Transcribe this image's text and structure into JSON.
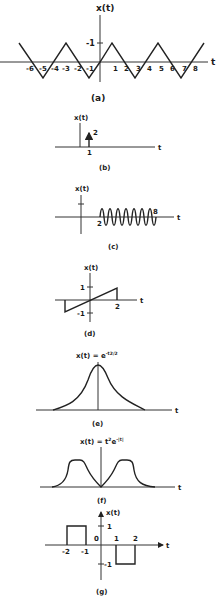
{
  "figure": {
    "panels": [
      {
        "id": "a",
        "caption": "(a)",
        "ylabel": "x(t)",
        "xlabel": "t",
        "description": "Triangular wave, period 4, amplitude 1",
        "xticks": [
          "-6",
          "-5",
          "-4",
          "-3",
          "-2",
          "-1",
          "1",
          "2",
          "3",
          "4",
          "5",
          "6",
          "7",
          "8"
        ],
        "ytick": "-1"
      },
      {
        "id": "b",
        "caption": "(b)",
        "ylabel": "x(t)",
        "xlabel": "t",
        "description": "Impulse of area 2 at t=1",
        "impulse_at": "1",
        "impulse_area": "2"
      },
      {
        "id": "c",
        "caption": "(c)",
        "ylabel": "x(t)",
        "xlabel": "t",
        "description": "Sinusoid between t=2 and t=8",
        "start": "2",
        "end": "8"
      },
      {
        "id": "d",
        "caption": "(d)",
        "ylabel": "x(t)",
        "xlabel": "t",
        "description": "Ramp from -1 to 1 ending at t=2",
        "ytick_pos": "1",
        "ytick_neg": "-1",
        "xtick": "2"
      },
      {
        "id": "e",
        "caption": "(e)",
        "title": "x(t) = e",
        "title_exp": "-t2/2",
        "xlabel": "t",
        "description": "Gaussian pulse"
      },
      {
        "id": "f",
        "caption": "(f)",
        "title": "x(t) = t",
        "title_sup": "2",
        "title_e": "e",
        "title_exp": "-|t|",
        "xlabel": "t",
        "description": "Double-hump signal"
      },
      {
        "id": "g",
        "caption": "(g)",
        "ylabel": "x(t)",
        "xlabel": "t",
        "description": "Rectangular pulses",
        "xticks": [
          "-2",
          "-1",
          "0",
          "1",
          "2"
        ],
        "ytick_pos": "1",
        "ytick_neg": "-1"
      }
    ]
  }
}
